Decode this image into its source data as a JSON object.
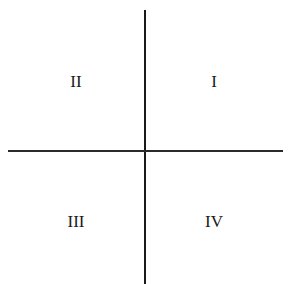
{
  "diagram": {
    "title": "",
    "quadrants": [
      {
        "id": "q1",
        "label": "I",
        "position": "top-right"
      },
      {
        "id": "q2",
        "label": "II",
        "position": "top-left"
      },
      {
        "id": "q3",
        "label": "III",
        "position": "bottom-left"
      },
      {
        "id": "q4",
        "label": "IV",
        "position": "bottom-right"
      }
    ],
    "colors": {
      "line": "#1a1a1a",
      "text": "#1a1a1a",
      "background": "#ffffff"
    }
  }
}
